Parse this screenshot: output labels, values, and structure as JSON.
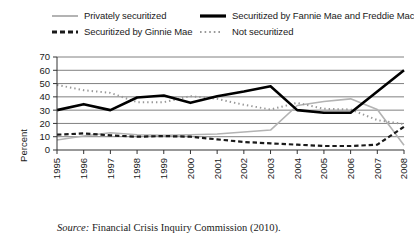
{
  "figure": {
    "ylabel": "Percent",
    "source_label": "Source:",
    "source_text": "Financial Crisis Inquiry Commission (2010)."
  },
  "legend": {
    "items": [
      {
        "label": "Privately securitized",
        "style": "solid",
        "color": "#b3b3b3",
        "row": 0,
        "col": 0
      },
      {
        "label": "Securitized by Fannie Mae and Freddie Mac",
        "style": "solid-thick",
        "color": "#000000",
        "row": 0,
        "col": 1
      },
      {
        "label": "Securitized by Ginnie Mae",
        "style": "dashed",
        "color": "#1a1a1a",
        "row": 1,
        "col": 0
      },
      {
        "label": "Not securitized",
        "style": "dotted",
        "color": "#999999",
        "row": 1,
        "col": 1
      }
    ]
  },
  "chart_data": {
    "type": "line",
    "title": "",
    "subtitle": "",
    "xlabel": "",
    "ylabel": "Percent",
    "x": [
      1995,
      1996,
      1997,
      1998,
      1999,
      2000,
      2001,
      2002,
      2003,
      2004,
      2005,
      2006,
      2007,
      2008
    ],
    "categories": [
      "1995",
      "1996",
      "1997",
      "1998",
      "1999",
      "2000",
      "2001",
      "2002",
      "2003",
      "2004",
      "2005",
      "2006",
      "2007",
      "2008"
    ],
    "xlim": [
      1995,
      2008
    ],
    "ylim": [
      0,
      70
    ],
    "yticks": [
      0,
      10,
      20,
      30,
      40,
      50,
      60,
      70
    ],
    "ytick_labels": [
      "0",
      "10",
      "20",
      "30",
      "40",
      "50",
      "60",
      "70"
    ],
    "grid": "horizontal",
    "legend_position": "above-plot",
    "series": [
      {
        "name": "Privately securitized",
        "color": "#b3b3b3",
        "style": "solid",
        "width": 1.6,
        "values": [
          7.5,
          10.5,
          13.0,
          11.5,
          11.0,
          11.5,
          12.0,
          13.5,
          15.0,
          33.5,
          36.5,
          38.5,
          30.5,
          3.5
        ]
      },
      {
        "name": "Securitized by Fannie Mae and Freddie Mac",
        "color": "#000000",
        "style": "solid",
        "width": 2.6,
        "values": [
          30.0,
          34.5,
          30.0,
          39.5,
          41.0,
          35.5,
          40.5,
          44.0,
          48.0,
          30.0,
          28.0,
          28.0,
          44.0,
          60.0
        ]
      },
      {
        "name": "Securitized by Ginnie Mae",
        "color": "#1a1a1a",
        "style": "dashed",
        "width": 2.2,
        "values": [
          11.5,
          12.5,
          11.0,
          10.0,
          10.5,
          10.0,
          8.0,
          6.0,
          5.0,
          4.0,
          3.0,
          3.0,
          4.0,
          17.5
        ]
      },
      {
        "name": "Not securitized",
        "color": "#999999",
        "style": "dotted",
        "width": 2.0,
        "values": [
          49.0,
          45.0,
          43.0,
          36.0,
          36.0,
          40.5,
          38.5,
          34.0,
          30.5,
          35.5,
          31.0,
          30.5,
          22.5,
          19.5
        ]
      }
    ],
    "annotations": []
  }
}
